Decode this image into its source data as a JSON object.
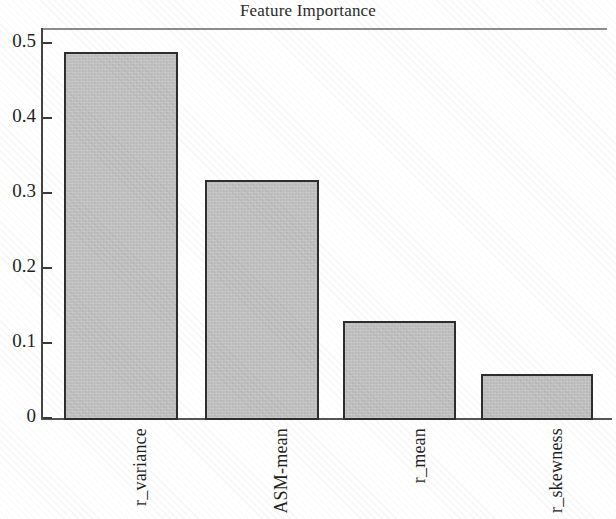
{
  "figure": {
    "title": "Feature Importance",
    "background_color": "#ffffff",
    "bar_fill_color": "#c2c2c2",
    "bar_edge_color": "#2e2e2e",
    "axis_color": "#444444"
  },
  "axes": {
    "y_ticks": [
      "0.5",
      "0.4",
      "0.3",
      "0.2",
      "0.1",
      "0"
    ],
    "x_ticks": [
      "r_variance",
      "ASM-mean",
      "r_mean",
      "r_skewness"
    ],
    "ylabel": "",
    "xlabel": ""
  },
  "chart_data": {
    "type": "bar",
    "title": "Feature Importance",
    "xlabel": "",
    "ylabel": "",
    "categories": [
      "r_variance",
      "ASM-mean",
      "r_mean",
      "r_skewness"
    ],
    "values": [
      0.488,
      0.317,
      0.13,
      0.059
    ],
    "ylim": [
      0,
      0.5
    ],
    "yticks": [
      0,
      0.1,
      0.2,
      0.3,
      0.4,
      0.5
    ],
    "ytick_labels": [
      "0",
      "0.1",
      "0.2",
      "0.3",
      "0.4",
      "0.5"
    ],
    "grid": false,
    "legend": null,
    "bar_fill_color": "#c2c2c2",
    "bar_edge_color": "#2e2e2e",
    "xtick_label_rotation": 90
  }
}
